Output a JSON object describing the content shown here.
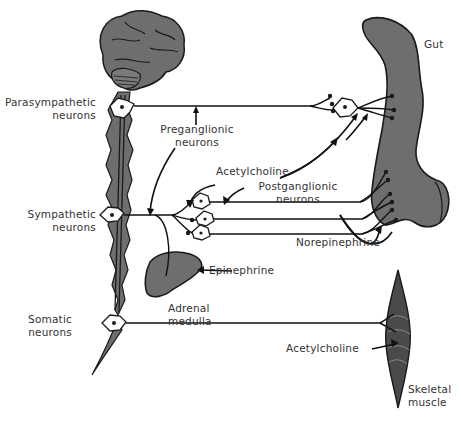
{
  "figure": {
    "type": "diagram",
    "colors": {
      "tissue_fill": "#6e6e6e",
      "tissue_outline": "#1a1a1a",
      "line": "#111111",
      "text": "#333333",
      "background": "#ffffff"
    }
  },
  "labels": {
    "parasympathetic": [
      "Parasympathetic",
      "neurons"
    ],
    "preganglionic": [
      "Preganglionic",
      "neurons"
    ],
    "gut": "Gut",
    "acetylcholine_top": "Acetylcholine",
    "postganglionic": [
      "Postganglionic",
      "neurons"
    ],
    "sympathetic": [
      "Sympathetic",
      "neurons"
    ],
    "norepinephrine": "Norepinephrine",
    "epinephrine": "Epinephrine",
    "adrenal": [
      "Adrenal",
      "medulla"
    ],
    "somatic": [
      "Somatic",
      "neurons"
    ],
    "acetylcholine_bottom": "Acetylcholine",
    "skeletal": [
      "Skeletal",
      "muscle"
    ]
  },
  "structures": [
    {
      "name": "Brain",
      "icon": "brain-icon"
    },
    {
      "name": "Spinal cord",
      "icon": "spinal-cord-icon"
    },
    {
      "name": "Gut",
      "icon": "gut-icon"
    },
    {
      "name": "Adrenal medulla",
      "icon": "adrenal-gland-icon"
    },
    {
      "name": "Skeletal muscle",
      "icon": "muscle-icon"
    }
  ],
  "pathways": [
    {
      "system": "Parasympathetic",
      "from": "Parasympathetic neurons",
      "via": "Ganglion near gut",
      "to": "Gut",
      "transmitter": "Acetylcholine"
    },
    {
      "system": "Sympathetic",
      "from": "Sympathetic neurons",
      "via": "Sympathetic ganglion",
      "to": "Gut",
      "transmitter": "Norepinephrine"
    },
    {
      "system": "Sympathetic",
      "from": "Sympathetic neurons",
      "via": "Direct",
      "to": "Adrenal medulla",
      "transmitter": "Epinephrine"
    },
    {
      "system": "Somatic",
      "from": "Somatic neurons",
      "via": "Direct",
      "to": "Skeletal muscle",
      "transmitter": "Acetylcholine"
    }
  ]
}
